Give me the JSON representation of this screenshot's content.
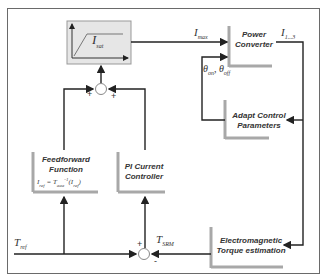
{
  "diagram": {
    "blocks": {
      "saturation": {
        "label": "I",
        "sub": "sat"
      },
      "power_converter": {
        "line1": "Power",
        "line2": "Converter"
      },
      "adapt_control": {
        "line1": "Adapt Control",
        "line2": "Parameters"
      },
      "feedforward": {
        "line1": "Feedforward",
        "line2": "Function",
        "formula_lhs": "I",
        "formula_lhs_sub": "ref",
        "formula_eq": " = T",
        "formula_t_sub": "aaa",
        "formula_sup": "-1",
        "formula_arg": "(I",
        "formula_arg_sub": "ref",
        "formula_close": ")"
      },
      "pi_controller": {
        "line1": "PI Current",
        "line2": "Controller"
      },
      "torque_estimation": {
        "line1": "Electromagnetic",
        "line2": "Torque estimation"
      }
    },
    "signals": {
      "imax": {
        "base": "I",
        "sub": "max"
      },
      "i_phase": {
        "base": "I",
        "sub": "1...3"
      },
      "theta": {
        "a": "θ",
        "a_sub": "on",
        "sep": ", ",
        "b": "θ",
        "b_sub": "off"
      },
      "tref": {
        "base": "T",
        "sub": "ref"
      },
      "tsrm": {
        "base": "T",
        "sub": "SRM"
      }
    },
    "summing_junctions": {
      "top": {
        "left_sign": "+",
        "right_sign": "+"
      },
      "bottom": {
        "top_sign": "+",
        "bottom_sign": "-"
      }
    }
  }
}
